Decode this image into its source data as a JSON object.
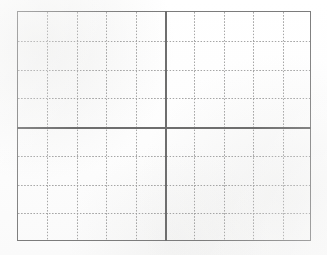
{
  "document": {
    "kind": "grid-worksheet",
    "title": "",
    "caption": "",
    "background_color": "#ffffff",
    "canvas": {
      "width": 327,
      "height": 255
    }
  },
  "grid": {
    "frame": {
      "left": 17,
      "top": 11,
      "width": 294,
      "height": 230,
      "border_color": "#7c7c7c",
      "border_width": 1.5,
      "fill": "none"
    },
    "quadrants": {
      "count": 4,
      "columns": 2,
      "rows": 2,
      "divider_color": "#6e6e6e",
      "divider_width": 1.6,
      "center_x": 147,
      "center_y": 115,
      "labels": [
        "top-left",
        "top-right",
        "bottom-left",
        "bottom-right"
      ]
    },
    "minor": {
      "style": "dotted",
      "color": "#9a9a9a",
      "dot_period": 3.1,
      "columns_per_quadrant": 5,
      "rows_per_quadrant": 4,
      "total_columns": 10,
      "total_rows": 8,
      "cell_width": 29.4,
      "cell_height": 28.75,
      "vertical_positions": [
        29.4,
        58.8,
        88.2,
        117.6,
        176.4,
        205.8,
        235.2,
        264.6
      ],
      "horizontal_positions": [
        28.75,
        57.5,
        86.25,
        143.75,
        172.5,
        201.25
      ]
    }
  },
  "annotations": {
    "items": []
  }
}
